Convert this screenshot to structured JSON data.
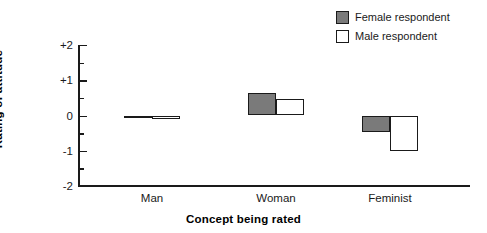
{
  "chart_data": {
    "type": "bar",
    "title": "",
    "xlabel": "Concept being rated",
    "ylabel": "Rating of attitude",
    "categories": [
      "Man",
      "Woman",
      "Feminist"
    ],
    "series": [
      {
        "name": "Female respondent",
        "values": [
          0.0,
          0.65,
          -0.48
        ],
        "color": "#7a7a7a"
      },
      {
        "name": "Male respondent",
        "values": [
          -0.1,
          0.47,
          -1.02
        ],
        "color": "#ffffff"
      }
    ],
    "ylim": [
      -2,
      2
    ],
    "ytick_labels": [
      "+2",
      "+1",
      "0",
      "-1",
      "-2"
    ],
    "ytick_values": [
      2,
      1,
      0,
      -1,
      -2
    ],
    "minor_ticks": [
      1.5,
      0.5,
      -0.5,
      -1.5
    ],
    "grid": false,
    "legend_position": "top-right"
  },
  "legend": {
    "entries": [
      {
        "label": "Female respondent",
        "swatch": "filled-gray-square"
      },
      {
        "label": "Male respondent",
        "swatch": "outlined-white-square"
      }
    ]
  }
}
